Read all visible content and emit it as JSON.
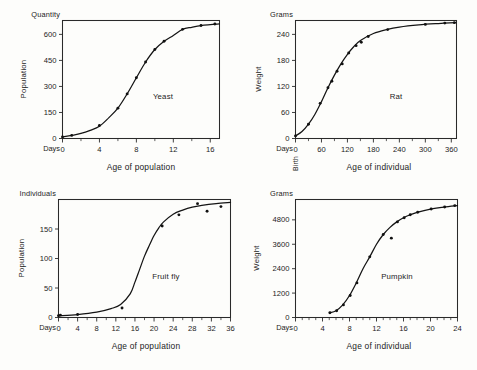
{
  "figure": {
    "background": "#fdfdfb",
    "ink": "#141414",
    "panel_count": 4
  },
  "chart_data": [
    {
      "type": "scatter",
      "title": "Yeast",
      "series_label": "Yeast",
      "xlabel": "Age of population",
      "ylabel": "Population",
      "x_unit": "Days",
      "y_unit": "Quantity",
      "grid": false,
      "legend": "inline-annotation",
      "xlim": [
        0,
        17
      ],
      "ylim": [
        0,
        680
      ],
      "xticks": [
        0,
        4,
        8,
        12,
        16
      ],
      "xticklabels": [
        "0",
        "4",
        "8",
        "12",
        "16"
      ],
      "xtick_minor_step": 2,
      "yticks": [
        0,
        150,
        300,
        450,
        600
      ],
      "yticklabels": [
        "0",
        "150",
        "300",
        "450",
        "600"
      ],
      "x": [
        0,
        1,
        2,
        3,
        4,
        5,
        6,
        7,
        8,
        9,
        10,
        11,
        12,
        13,
        14,
        15,
        16,
        17
      ],
      "y": [
        9,
        18,
        29,
        47,
        71,
        119,
        175,
        257,
        350,
        441,
        513,
        560,
        594,
        629,
        641,
        651,
        656,
        660
      ],
      "points_x": [
        0,
        1,
        4,
        6,
        7,
        8,
        9,
        10,
        11,
        13,
        15,
        16.5
      ],
      "points_y": [
        9,
        18,
        75,
        175,
        257,
        350,
        441,
        513,
        560,
        629,
        651,
        660
      ],
      "fit": "sigmoid"
    },
    {
      "type": "scatter",
      "title": "Rat",
      "series_label": "Rat",
      "xlabel": "Age of individual",
      "ylabel": "Weight",
      "x_unit": "Days",
      "y_unit": "Grams",
      "x_origin_note": "Birth",
      "grid": false,
      "legend": "inline-annotation",
      "xlim": [
        0,
        372
      ],
      "ylim": [
        0,
        272
      ],
      "xticks": [
        0,
        60,
        120,
        180,
        240,
        300,
        360
      ],
      "xticklabels": [
        "0",
        "60",
        "120",
        "180",
        "240",
        "300",
        "360"
      ],
      "xtick_minor_step": 30,
      "yticks": [
        0,
        60,
        120,
        180,
        240
      ],
      "yticklabels": [
        "0",
        "60",
        "120",
        "180",
        "240"
      ],
      "x": [
        0,
        15,
        30,
        45,
        60,
        75,
        90,
        105,
        120,
        135,
        150,
        180,
        210,
        240,
        285,
        330,
        370
      ],
      "y": [
        6,
        16,
        33,
        56,
        85,
        117,
        146,
        172,
        194,
        212,
        226,
        242,
        251,
        257,
        262,
        265,
        267
      ],
      "points_x": [
        0,
        30,
        57,
        75,
        84,
        96,
        108,
        123,
        140,
        152,
        168,
        213,
        300,
        345,
        367
      ],
      "points_y": [
        6,
        33,
        81,
        117,
        132,
        155,
        172,
        197,
        214,
        222,
        235,
        251,
        263,
        266,
        267
      ],
      "fit": "sigmoid"
    },
    {
      "type": "scatter",
      "title": "Fruit fly",
      "series_label": "Fruit fly",
      "xlabel": "Age of population",
      "ylabel": "Population",
      "x_unit": "Days",
      "y_unit": "Individuals",
      "grid": false,
      "legend": "inline-annotation",
      "xlim": [
        0,
        36
      ],
      "ylim": [
        0,
        200
      ],
      "xticks": [
        0,
        4,
        8,
        12,
        16,
        20,
        24,
        28,
        32,
        36
      ],
      "xticklabels": [
        "0",
        "4",
        "8",
        "12",
        "16",
        "20",
        "24",
        "28",
        "32",
        "36"
      ],
      "xtick_minor_step": 2,
      "yticks": [
        0,
        50,
        100,
        150
      ],
      "yticklabels": [
        "0",
        "50",
        "100",
        "150"
      ],
      "x": [
        0,
        4,
        8,
        11,
        13,
        15,
        16,
        17,
        18,
        19,
        20,
        21,
        22,
        24,
        26,
        28,
        30,
        33,
        36
      ],
      "y": [
        3,
        5,
        9,
        15,
        22,
        40,
        60,
        82,
        104,
        122,
        139,
        152,
        162,
        175,
        182,
        187,
        190,
        193,
        195
      ],
      "points_x": [
        0,
        0.4,
        4,
        13.3,
        21.7,
        25.2,
        29.1,
        31.1,
        34
      ],
      "points_y": [
        3,
        4,
        5,
        16,
        155,
        174,
        193,
        180,
        188
      ],
      "fit": "sigmoid",
      "note": "plateau points scatter above and below the fitted curve"
    },
    {
      "type": "scatter",
      "title": "Pumpkin",
      "series_label": "Pumpkin",
      "xlabel": "Age of individual",
      "ylabel": "Weight",
      "x_unit": "Days",
      "y_unit": "Grams",
      "grid": false,
      "legend": "inline-annotation",
      "xlim": [
        0,
        24
      ],
      "ylim": [
        0,
        5800
      ],
      "xticks": [
        0,
        4,
        8,
        12,
        16,
        20,
        24
      ],
      "xticklabels": [
        "0",
        "4",
        "8",
        "12",
        "16",
        "20",
        "24"
      ],
      "xtick_minor_step": 1,
      "yticks": [
        0,
        1200,
        2400,
        3600,
        4800
      ],
      "yticklabels": [
        "0",
        "1200",
        "2400",
        "3600",
        "4800"
      ],
      "x": [
        5,
        6,
        7,
        8,
        9,
        10,
        11,
        12,
        13,
        14,
        15,
        16,
        17,
        18,
        20,
        22,
        24
      ],
      "y": [
        230,
        330,
        620,
        1080,
        1700,
        2400,
        2980,
        3600,
        4080,
        4430,
        4700,
        4900,
        5050,
        5170,
        5330,
        5430,
        5500
      ],
      "points_x": [
        5.1,
        6.1,
        7.1,
        8.1,
        9.1,
        11.0,
        13.0,
        14.2,
        15.1,
        16.1,
        17.0,
        18.1,
        20.1,
        22.1,
        23.6
      ],
      "points_y": [
        230,
        330,
        620,
        1080,
        1700,
        2980,
        4080,
        3900,
        4700,
        4900,
        5050,
        5170,
        5330,
        5430,
        5500
      ],
      "fit": "sigmoid",
      "note": "one point near day 14 falls noticeably below the fitted curve"
    }
  ]
}
